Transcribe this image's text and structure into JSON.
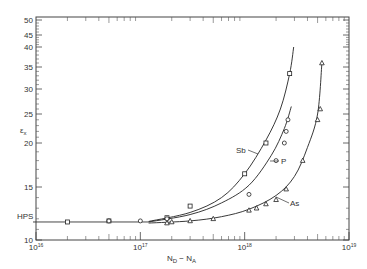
{
  "chart_data": {
    "type": "line",
    "title": "",
    "xlabel": "N_D − N_A",
    "xlabel_main": "N",
    "xlabel_sub_d": "D",
    "xlabel_sub_a": "A",
    "ylabel": "εx",
    "ylabel_main": "ε",
    "ylabel_sub": "x",
    "xscale": "log",
    "xlim": [
      1e+16,
      1e+19
    ],
    "ylim": [
      10,
      50
    ],
    "x_ticks": [
      {
        "value": 1e+16,
        "label_base": "10",
        "label_exp": "16"
      },
      {
        "value": 1e+17,
        "label_base": "10",
        "label_exp": "17"
      },
      {
        "value": 1e+18,
        "label_base": "10",
        "label_exp": "18"
      },
      {
        "value": 1e+19,
        "label_base": "10",
        "label_exp": "19"
      }
    ],
    "y_ticks": [
      {
        "value": 10,
        "label": "10",
        "py": 240
      },
      {
        "value": 15,
        "label": "15",
        "py": 187
      },
      {
        "value": 20,
        "label": "20",
        "py": 143
      },
      {
        "value": 25,
        "label": "25",
        "py": 114
      },
      {
        "value": 30,
        "label": "30",
        "py": 89
      },
      {
        "value": 35,
        "label": "35",
        "py": 67
      },
      {
        "value": 40,
        "label": "40",
        "py": 47
      },
      {
        "value": 45,
        "label": "45",
        "py": 35
      },
      {
        "value": 50,
        "label": "50",
        "py": 20
      }
    ],
    "reference_line": {
      "label": "HPS",
      "value": 11.7
    },
    "grid": false,
    "legend": "inline curve labels",
    "series": [
      {
        "name": "Sb",
        "marker": "square",
        "x": [
          2e+16,
          5e+16,
          1.8e+17,
          3e+17,
          1e+18,
          1.6e+18,
          2.7e+18
        ],
        "y": [
          11.7,
          11.8,
          12.1,
          13.2,
          16.5,
          20.0,
          33.5
        ]
      },
      {
        "name": "P",
        "marker": "circle",
        "x": [
          5e+16,
          1e+17,
          1.8e+17,
          1.1e+18,
          2e+18,
          2.4e+18,
          2.5e+18,
          2.6e+18
        ],
        "y": [
          11.8,
          11.8,
          12.0,
          14.3,
          18.0,
          20.0,
          22.0,
          24.0
        ]
      },
      {
        "name": "As",
        "marker": "triangle",
        "x": [
          1.8e+17,
          2e+17,
          3e+17,
          5e+17,
          1.1e+18,
          1.3e+18,
          1.6e+18,
          2e+18,
          2.5e+18,
          3.6e+18,
          5e+18,
          5.3e+18,
          5.5e+18
        ],
        "y": [
          11.6,
          11.7,
          11.8,
          12.0,
          12.8,
          13.0,
          13.4,
          13.8,
          14.8,
          18.0,
          24.0,
          26.0,
          36.0
        ]
      }
    ]
  },
  "labels": {
    "hps": "HPS",
    "sb": "Sb",
    "p": "P",
    "as": "As"
  }
}
